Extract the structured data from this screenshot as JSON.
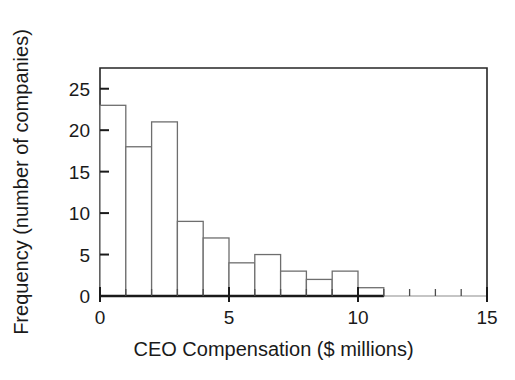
{
  "chart_data": {
    "type": "bar",
    "subtype": "histogram",
    "title": "",
    "xlabel": "CEO Compensation ($ millions)",
    "ylabel": "Frequency (number of companies)",
    "xlim": [
      0,
      15
    ],
    "ylim": [
      0,
      27.5
    ],
    "xticks": [
      0,
      5,
      10,
      15
    ],
    "xtick_labels": [
      "0",
      "5",
      "10",
      "15"
    ],
    "yticks": [
      0,
      5,
      10,
      15,
      20,
      25
    ],
    "ytick_labels": [
      "0",
      "5",
      "10",
      "15",
      "20",
      "25"
    ],
    "x_minor_tick_step": 1,
    "grid": false,
    "legend": null,
    "bin_width": 1,
    "bin_edges": [
      0,
      1,
      2,
      3,
      4,
      5,
      6,
      7,
      8,
      9,
      10,
      11
    ],
    "categories": [
      "0-1",
      "1-2",
      "2-3",
      "3-4",
      "4-5",
      "5-6",
      "6-7",
      "7-8",
      "8-9",
      "9-10",
      "10-11"
    ],
    "values": [
      23,
      18,
      21,
      9,
      7,
      4,
      5,
      3,
      2,
      3,
      1
    ],
    "bar_fill_color": "#ffffff",
    "bar_edge_color": "#6e6e6e",
    "axis_color": "#1a1a1a",
    "background_color": "#ffffff"
  },
  "figure": {
    "plot_frame": {
      "left": 100,
      "top": 68,
      "right": 487,
      "bottom": 296
    }
  }
}
